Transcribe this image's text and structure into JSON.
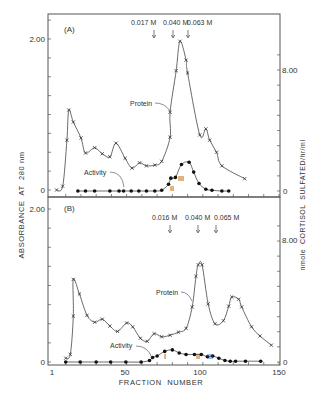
{
  "figure": {
    "xlabel": "FRACTION  NUMBER",
    "ylabel_left": "ABSORBANCE  AT  280 nm",
    "ylabel_right": "nmole  CORTISOL  SULFATED/hr/ml",
    "x_ticks": [
      "1",
      "50",
      "100",
      "150"
    ],
    "left_ticks": {
      "top": "2.00",
      "zero": "0"
    },
    "right_ticks": {
      "top": "8.00",
      "zero": "0"
    }
  },
  "panel_a": {
    "label": "(A)",
    "protein_label": "Protein",
    "activity_label": "Activity",
    "gradient_markers": [
      {
        "label": "0.017 M",
        "fraction": 80
      },
      {
        "label": "0.040 M",
        "fraction": 82
      },
      {
        "label": "0.063 M",
        "fraction": 90
      }
    ],
    "peak_labels": [
      {
        "label": "II",
        "fraction": 79
      },
      {
        "label": "III",
        "fraction": 85
      }
    ]
  },
  "panel_b": {
    "label": "(B)",
    "protein_label": "Protein",
    "activity_label": "Activity",
    "gradient_markers": [
      {
        "label": "0.016 M",
        "fraction": 78
      },
      {
        "label": "0.040 M",
        "fraction": 96
      },
      {
        "label": "0.065 M",
        "fraction": 109
      }
    ],
    "peak_labels": [
      {
        "label": "I",
        "fraction": 74
      },
      {
        "label": "II",
        "fraction": 98
      },
      {
        "label": "III",
        "fraction": 105
      }
    ]
  },
  "chart_data": [
    {
      "type": "line",
      "title": "(A)",
      "xlabel": "FRACTION NUMBER",
      "ylabel": "ABSORBANCE AT 280 nm",
      "ylabel_right": "nmole CORTISOL SULFATED/hr/ml",
      "xlim": [
        1,
        150
      ],
      "ylim": [
        0,
        2.0
      ],
      "ylim_right": [
        0,
        8.0
      ],
      "series": [
        {
          "name": "Protein",
          "axis": "left",
          "marker": "x",
          "x": [
            4,
            8,
            10.8,
            12,
            15,
            20,
            23,
            29,
            34,
            39,
            43,
            49,
            53.5,
            58.5,
            63,
            68.5,
            73,
            78.5,
            78.5,
            82.5,
            85,
            89,
            90,
            98,
            102,
            104.5,
            109,
            112.5,
            127.5
          ],
          "y": [
            0,
            0.05,
            0.66,
            1.06,
            0.9,
            0.69,
            0.49,
            0.56,
            0.48,
            0.44,
            0.62,
            0.42,
            0.29,
            0.36,
            0.32,
            0.33,
            0.38,
            0.7,
            1.03,
            1.58,
            1.97,
            1.72,
            1.55,
            0.73,
            0.81,
            0.66,
            0.5,
            0.32,
            0.15
          ]
        },
        {
          "name": "Activity",
          "axis": "right",
          "marker": "filled-circle",
          "x": [
            18,
            23,
            29,
            39,
            45,
            48,
            53,
            58,
            63,
            68.5,
            73,
            77.5,
            79,
            82,
            86,
            91,
            94,
            97.5,
            102,
            106,
            112.5,
            117
          ],
          "y": [
            0,
            0,
            0,
            0,
            0,
            0,
            0,
            0,
            0,
            0,
            0.05,
            0.45,
            0.85,
            0.9,
            1.75,
            1.9,
            1.25,
            0.5,
            0.12,
            0.05,
            0,
            0
          ]
        }
      ]
    },
    {
      "type": "line",
      "title": "(B)",
      "xlabel": "FRACTION NUMBER",
      "ylabel": "ABSORBANCE AT 280 nm",
      "ylabel_right": "nmole CORTISOL SULFATED/hr/ml",
      "xlim": [
        1,
        150
      ],
      "ylim": [
        0,
        2.0
      ],
      "ylim_right": [
        0,
        8.0
      ],
      "series": [
        {
          "name": "Protein",
          "axis": "left",
          "marker": "x",
          "x": [
            10,
            13,
            15,
            15,
            19,
            24,
            29,
            34,
            39,
            44,
            50,
            54,
            59,
            63.5,
            68,
            73,
            78.5,
            84,
            89,
            93,
            95.5,
            97,
            99.5,
            103.5,
            108,
            113.5,
            117,
            119,
            123.5,
            125.5,
            132,
            137.5,
            145
          ],
          "y": [
            0.05,
            0.1,
            0.6,
            1.08,
            0.89,
            0.61,
            0.52,
            0.56,
            0.47,
            0.4,
            0.51,
            0.46,
            0.31,
            0.27,
            0.37,
            0.33,
            0.35,
            0.39,
            0.44,
            0.72,
            1.12,
            1.27,
            1.27,
            0.76,
            0.5,
            0.54,
            0.73,
            0.85,
            0.82,
            0.72,
            0.46,
            0.34,
            0.22
          ]
        },
        {
          "name": "Activity",
          "axis": "right",
          "marker": "filled-circle",
          "x": [
            10,
            19.5,
            30,
            39.5,
            49.5,
            59.5,
            65,
            67,
            70,
            75,
            80,
            84.5,
            89,
            94.5,
            99,
            103,
            106.5,
            110.5,
            114.5,
            118,
            121.5,
            128,
            138
          ],
          "y": [
            0,
            0,
            0,
            0,
            0,
            0,
            0.1,
            0.3,
            0.4,
            0.7,
            0.8,
            0.6,
            0.5,
            0.5,
            0.5,
            0.35,
            0.4,
            0.25,
            0.1,
            0.05,
            0.05,
            0.05,
            0.05
          ]
        }
      ]
    }
  ]
}
